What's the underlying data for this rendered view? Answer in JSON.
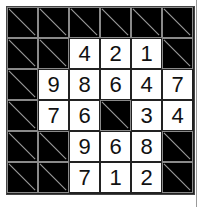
{
  "puzzle": {
    "type": "kakuro",
    "rows": 6,
    "cols": 6,
    "colors": {
      "block": "#000000",
      "entry_bg": "#ffffff",
      "digit": "#111111",
      "diagonal": "#9a9a9a"
    },
    "cells": [
      [
        "B",
        "B",
        "B",
        "B",
        "B",
        "B"
      ],
      [
        "B",
        "B",
        "4",
        "2",
        "1",
        "B"
      ],
      [
        "B",
        "9",
        "8",
        "6",
        "4",
        "7"
      ],
      [
        "B",
        "7",
        "6",
        "B",
        "3",
        "4"
      ],
      [
        "B",
        "B",
        "9",
        "6",
        "8",
        "B"
      ],
      [
        "B",
        "B",
        "7",
        "1",
        "2",
        "B"
      ]
    ]
  }
}
